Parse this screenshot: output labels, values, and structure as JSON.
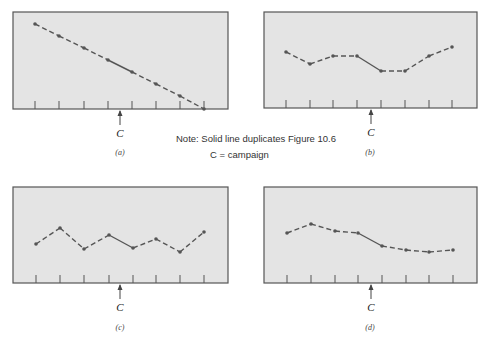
{
  "figure": {
    "note_line1": "Note: Solid line duplicates Figure 10.6",
    "note_line2": "C = campaign",
    "campaign_marker": "C",
    "colors": {
      "panel_bg": "#e4e4e4",
      "border": "#555555",
      "line": "#555555",
      "point": "#555555",
      "text": "#333333"
    }
  },
  "chart_data": [
    {
      "type": "line",
      "panel_label": "(a)",
      "x": [
        1,
        2,
        3,
        4,
        5,
        6,
        7,
        8
      ],
      "values": [
        7,
        6,
        5,
        4,
        3,
        2,
        1,
        0
      ],
      "solid_segment": [
        4,
        5
      ],
      "campaign_between": [
        4,
        5
      ],
      "title": "",
      "xlabel": "",
      "ylabel": "",
      "grid": false
    },
    {
      "type": "line",
      "panel_label": "(b)",
      "x": [
        1,
        2,
        3,
        4,
        5,
        6,
        7,
        8
      ],
      "values": [
        4.7,
        3.7,
        4.4,
        4.4,
        3.1,
        3.1,
        4.4,
        5.1
      ],
      "solid_segment": [
        4,
        5
      ],
      "campaign_between": [
        4,
        5
      ],
      "title": "",
      "xlabel": "",
      "ylabel": "",
      "grid": false
    },
    {
      "type": "line",
      "panel_label": "(c)",
      "x": [
        1,
        2,
        3,
        4,
        5,
        6,
        7,
        8
      ],
      "values": [
        3.3,
        4.6,
        2.8,
        4.0,
        2.9,
        3.7,
        2.6,
        4.3
      ],
      "solid_segment": [
        4,
        5
      ],
      "campaign_between": [
        4,
        5
      ],
      "title": "",
      "xlabel": "",
      "ylabel": "",
      "grid": false
    },
    {
      "type": "line",
      "panel_label": "(d)",
      "x": [
        1,
        2,
        3,
        4,
        5,
        6,
        7,
        8
      ],
      "values": [
        4.2,
        5.0,
        4.4,
        4.2,
        3.1,
        2.8,
        2.6,
        2.8
      ],
      "solid_segment": [
        4,
        5
      ],
      "campaign_between": [
        4,
        5
      ],
      "title": "",
      "xlabel": "",
      "ylabel": "",
      "grid": false
    }
  ],
  "layout": {
    "panels": [
      {
        "box": [
          13,
          12,
          228,
          109
        ],
        "points_y": [
          24,
          36,
          48,
          60,
          72,
          84,
          96,
          109
        ],
        "points_x": [
          35,
          59,
          84,
          108,
          132,
          156,
          180,
          204
        ],
        "label_pos": [
          120,
          155
        ],
        "c_x": 120
      },
      {
        "box": [
          264,
          12,
          477,
          108
        ],
        "points_y": [
          52,
          64,
          56,
          56,
          71,
          71,
          56,
          47
        ],
        "points_x": [
          286,
          310,
          333,
          357,
          381,
          405,
          429,
          452
        ],
        "label_pos": [
          370,
          155
        ],
        "c_x": 371
      },
      {
        "box": [
          13,
          187,
          228,
          283
        ],
        "points_y": [
          244,
          228,
          249,
          235,
          248,
          239,
          252,
          232
        ],
        "points_x": [
          36,
          60,
          84,
          109,
          133,
          156,
          180,
          204
        ],
        "label_pos": [
          120,
          330
        ],
        "c_x": 120
      },
      {
        "box": [
          264,
          187,
          477,
          283
        ],
        "points_y": [
          233,
          224,
          231,
          233,
          246,
          250,
          252,
          250
        ],
        "points_x": [
          287,
          311,
          335,
          358,
          382,
          406,
          429,
          453
        ],
        "label_pos": [
          370,
          330
        ],
        "c_x": 371
      }
    ]
  }
}
